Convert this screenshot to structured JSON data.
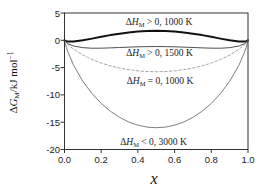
{
  "figure": {
    "y_axis_title": {
      "delta": "Δ",
      "symbol": "G",
      "sub": "M",
      "rest": "/kJ mol",
      "sup": "−1"
    },
    "x_axis_title": "x",
    "ytick_labels": [
      "5",
      "0",
      "-5",
      "-10",
      "-15",
      "-20"
    ],
    "xtick_labels": [
      "0.0",
      "0.2",
      "0.4",
      "0.6",
      "0.8",
      "1.0"
    ],
    "annotations": [
      {
        "delta": "Δ",
        "symbol": "H",
        "sub": "M",
        "rest": " > 0,  1000 K"
      },
      {
        "delta": "Δ",
        "symbol": "H",
        "sub": "M",
        "rest": " > 0,  1500 K"
      },
      {
        "delta": "Δ",
        "symbol": "H",
        "sub": "M",
        "rest": " = 0,  1000 K"
      },
      {
        "delta": "Δ",
        "symbol": "H",
        "sub": "M",
        "rest": " < 0,  3000 K"
      }
    ],
    "colors": {
      "frame": "#333333",
      "tick": "#333333",
      "background": "#ffffff"
    }
  },
  "chart_data": {
    "type": "line",
    "title": "",
    "xlabel": "x",
    "ylabel": "ΔG_M / kJ mol^-1",
    "xlim": [
      0,
      1
    ],
    "ylim": [
      -20,
      5
    ],
    "xticks": [
      0,
      0.2,
      0.4,
      0.6,
      0.8,
      1.0
    ],
    "yticks": [
      5,
      0,
      -5,
      -10,
      -15,
      -20
    ],
    "grid": false,
    "legend": "inline-annotations",
    "x": [
      0,
      0.001,
      0.01,
      0.02,
      0.05,
      0.1,
      0.15,
      0.2,
      0.25,
      0.3,
      0.35,
      0.4,
      0.45,
      0.5,
      0.55,
      0.6,
      0.65,
      0.7,
      0.75,
      0.8,
      0.85,
      0.9,
      0.95,
      0.98,
      0.99,
      0.999,
      1
    ],
    "series": [
      {
        "name": "ΔH_M > 0, 1000 K",
        "style": {
          "color": "#111111",
          "width": 2,
          "dash": ""
        },
        "values": [
          0,
          -0.04,
          -0.17,
          -0.23,
          -0.23,
          0.0,
          0.31,
          0.64,
          0.95,
          1.22,
          1.44,
          1.6,
          1.7,
          1.74,
          1.7,
          1.6,
          1.44,
          1.22,
          0.95,
          0.64,
          0.31,
          0.0,
          -0.23,
          -0.23,
          -0.17,
          -0.04,
          0
        ]
      },
      {
        "name": "ΔH_M > 0, 1500 K",
        "style": {
          "color": "#3c3c3c",
          "width": 0.9,
          "dash": ""
        },
        "values": [
          0,
          -0.07,
          -0.4,
          -0.63,
          -1.05,
          -1.35,
          -1.45,
          -1.44,
          -1.39,
          -1.32,
          -1.25,
          -1.19,
          -1.16,
          -1.14,
          -1.16,
          -1.19,
          -1.25,
          -1.32,
          -1.39,
          -1.44,
          -1.45,
          -1.35,
          -1.05,
          -0.63,
          -0.4,
          -0.07,
          0
        ]
      },
      {
        "name": "ΔH_M = 0, 1000 K",
        "style": {
          "color": "#9a9a9a",
          "width": 0.9,
          "dash": "2.5,2.2"
        },
        "values": [
          0,
          -0.07,
          -0.47,
          -0.82,
          -1.65,
          -2.7,
          -3.51,
          -4.16,
          -4.68,
          -5.08,
          -5.38,
          -5.6,
          -5.72,
          -5.76,
          -5.72,
          -5.6,
          -5.38,
          -5.08,
          -4.68,
          -4.16,
          -3.51,
          -2.7,
          -1.65,
          -0.82,
          -0.47,
          -0.07,
          0
        ]
      },
      {
        "name": "ΔH_M < 0, 3000 K",
        "style": {
          "color": "#6f6f6f",
          "width": 0.9,
          "dash": ""
        },
        "values": [
          0,
          -0.18,
          -1.29,
          -2.26,
          -4.59,
          -7.51,
          -9.76,
          -11.56,
          -12.99,
          -14.11,
          -14.96,
          -15.55,
          -15.9,
          -16.01,
          -15.9,
          -15.55,
          -14.96,
          -14.11,
          -12.99,
          -11.56,
          -9.76,
          -7.51,
          -4.59,
          -2.26,
          -1.29,
          -0.18,
          0
        ]
      }
    ]
  }
}
